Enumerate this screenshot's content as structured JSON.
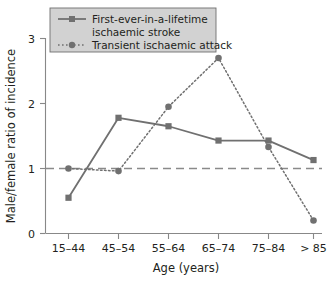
{
  "chart_data": {
    "type": "line",
    "title": "",
    "xlabel": "Age (years)",
    "ylabel": "Male/female ratio of incidence",
    "categories": [
      "15–44",
      "45–54",
      "55–64",
      "65–74",
      "75–84",
      "> 85"
    ],
    "ylim": [
      0,
      3
    ],
    "yticks": [
      0,
      1,
      2,
      3
    ],
    "ytick_labels": [
      "0",
      "1",
      "2",
      "3"
    ],
    "grid": false,
    "legend_position": "top-left",
    "reference_line": {
      "value": 1,
      "style": "dashed",
      "color": "#8a8a8a"
    },
    "series": [
      {
        "name": "First-ever-in-a-lifetime ischaemic stroke",
        "style": "solid",
        "marker": "square",
        "color": "#707070",
        "values": [
          0.55,
          1.78,
          1.65,
          1.43,
          1.43,
          1.13
        ]
      },
      {
        "name": "Transient ischaemic attack",
        "style": "dotted",
        "marker": "circle",
        "color": "#707070",
        "values": [
          1.0,
          0.96,
          1.95,
          2.7,
          1.33,
          0.2
        ]
      }
    ]
  },
  "legend": {
    "entries": [
      {
        "label_line1": "First-ever-in-a-lifetime",
        "label_line2": "ischaemic stroke"
      },
      {
        "label_line1": "Transient ischaemic attack",
        "label_line2": ""
      }
    ]
  },
  "axes": {
    "y_title": "Male/female ratio of incidence",
    "x_title": "Age (years)",
    "y_tick_0": "0",
    "y_tick_1": "1",
    "y_tick_2": "2",
    "y_tick_3": "3",
    "x_tick_0": "15–44",
    "x_tick_1": "45–54",
    "x_tick_2": "55–64",
    "x_tick_3": "65–74",
    "x_tick_4": "75–84",
    "x_tick_5": "> 85"
  },
  "colors": {
    "series": "#707070",
    "axis": "#888888",
    "reference": "#8a8a8a",
    "legend_bg": "#d2d2d2",
    "legend_border": "#6f6f6f",
    "text": "#231f20"
  }
}
